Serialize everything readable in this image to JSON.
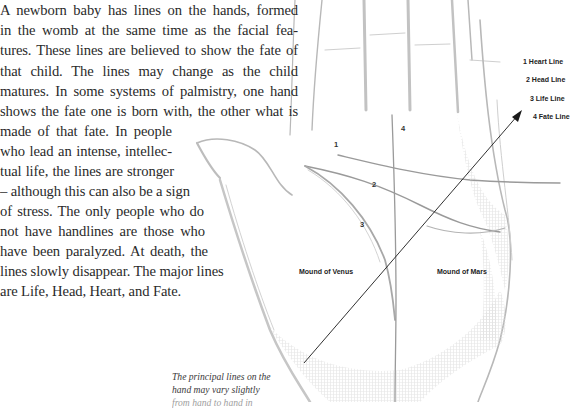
{
  "body_text": {
    "lines": [
      "A newborn baby has lines on the hands, formed",
      "in the womb at the same time as the facial fea-",
      "tures. These lines are believed to show the fate of",
      "that child. The lines may change as the child",
      "matures. In some systems of palmistry, one hand",
      "shows the fate one is born with, the other what is",
      "made of that fate. In people",
      "who lead an intense, intellec-",
      "tual life, the lines are stronger",
      "– although this can also be a sign",
      "of stress. The only people who do",
      "not have handlines are those who",
      "have been paralyzed. At death, the",
      "lines slowly disappear. The major lines",
      "are Life, Head, Heart, and Fate."
    ]
  },
  "caption": {
    "lines": [
      "The principal lines on the",
      "hand may vary slightly",
      "from hand to hand in"
    ]
  },
  "diagram": {
    "line_numbers": {
      "heart": "1",
      "head": "2",
      "life": "3",
      "fate": "4"
    },
    "mounds": {
      "venus": "Mound of Venus",
      "mars": "Mound of Mars"
    },
    "legend": [
      {
        "number": "1",
        "label": "1 Heart Line"
      },
      {
        "number": "2",
        "label": "2 Head Line"
      },
      {
        "number": "3",
        "label": "3 Life Line"
      },
      {
        "number": "4",
        "label": "4 Fate Line"
      }
    ],
    "colors": {
      "sketch": "#b8b8b8",
      "palm_line": "#9a9a9a",
      "arrow": "#1a1a1a"
    }
  }
}
